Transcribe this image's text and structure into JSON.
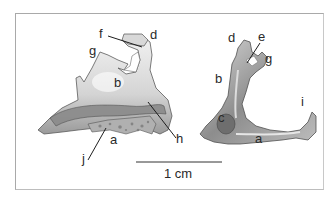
{
  "figure": {
    "specimen_left": {
      "labels": [
        "f",
        "d",
        "g",
        "b",
        "h",
        "a",
        "j"
      ]
    },
    "specimen_right": {
      "labels": [
        "d",
        "e",
        "g",
        "b",
        "i",
        "c",
        "a"
      ]
    },
    "scale_bar": {
      "label": "1 cm"
    },
    "colors": {
      "frame": "#a9a9a9",
      "bone_light": "#e6e6e6",
      "bone_mid": "#a8a8a8",
      "bone_dark": "#6a6a6a",
      "text": "#2a2a2a"
    }
  }
}
